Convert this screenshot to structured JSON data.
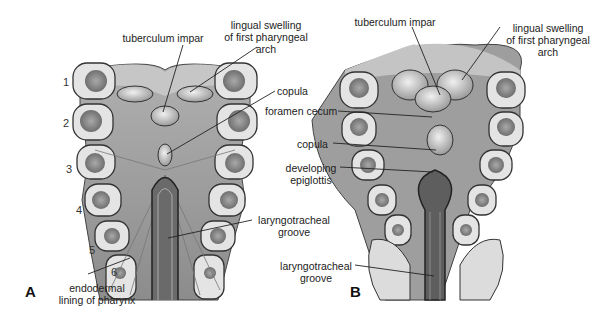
{
  "figure": {
    "panels": [
      {
        "id": "A",
        "label": "A",
        "arch_numbers": [
          "1",
          "2",
          "3",
          "4",
          "5",
          "6"
        ],
        "labels": {
          "tuberculum_impar": "tuberculum impar",
          "lingual_swelling_1": "lingual swelling",
          "lingual_swelling_2": "of first pharyngeal",
          "lingual_swelling_3": "arch",
          "copula": "copula",
          "laryngotracheal_1": "laryngotracheal",
          "laryngotracheal_2": "groove",
          "endodermal_1": "endodermal",
          "endodermal_2": "lining of pharynx"
        }
      },
      {
        "id": "B",
        "label": "B",
        "labels": {
          "tuberculum_impar": "tuberculum impar",
          "lingual_swelling_1": "lingual swelling",
          "lingual_swelling_2": "of first pharyngeal",
          "lingual_swelling_3": "arch",
          "foramen_cecum": "foramen cecum",
          "copula": "copula",
          "epiglottis_1": "developing",
          "epiglottis_2": "epiglottis",
          "laryngotracheal_1": "laryngotracheal",
          "laryngotracheal_2": "groove"
        }
      }
    ],
    "colors": {
      "tissue_dark": "#8a8a8a",
      "tissue_mid": "#b4b4b4",
      "tissue_light": "#d8d8d8",
      "arch_fill": "#e6e6e6",
      "outline": "#333333",
      "leader": "#222222"
    }
  }
}
